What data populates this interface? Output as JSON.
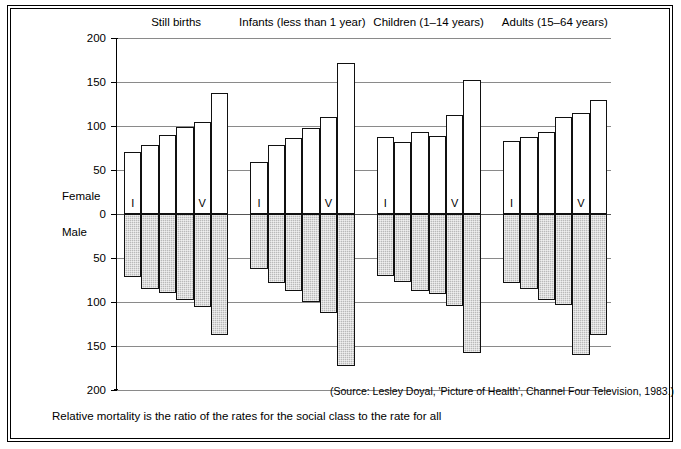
{
  "figure": {
    "axis_labels": {
      "female": "Female",
      "male": "Male"
    },
    "source": "(Source: Lesley Doyal, 'Picture of Health', Channel Four Television, 1983.)",
    "caption": "Relative mortality is the ratio of the rates for the social class to the rate for all",
    "class_label_first": "I",
    "class_label_fifth": "V"
  },
  "chart_data": {
    "type": "bar",
    "title": "",
    "subtitle": "",
    "xlabel": "",
    "ylabel": "",
    "orientation": "vertical",
    "layout": "back-to-back population pyramid: Female above zero, Male below zero",
    "grid": true,
    "legend_position": "none",
    "yticks_upper": [
      0,
      50,
      100,
      150,
      200
    ],
    "yticks_lower": [
      0,
      50,
      100,
      150,
      200
    ],
    "ytick_labels": [
      "200",
      "150",
      "100",
      "50",
      "0",
      "50",
      "100",
      "150",
      "200"
    ],
    "ylim_female": [
      0,
      200
    ],
    "ylim_male": [
      0,
      200
    ],
    "categories": [
      "I",
      "II",
      "IIIN",
      "IIIM",
      "IV",
      "V"
    ],
    "visible_category_labels": [
      "I",
      "",
      "",
      "",
      "V",
      ""
    ],
    "groups": [
      {
        "name": "Still births",
        "female": [
          71,
          78,
          90,
          99,
          105,
          138
        ],
        "male": [
          72,
          85,
          90,
          98,
          106,
          138
        ]
      },
      {
        "name": "Infants (less than 1 year)",
        "female": [
          59,
          78,
          86,
          98,
          110,
          172
        ],
        "male": [
          62,
          78,
          88,
          100,
          112,
          173
        ]
      },
      {
        "name": "Children  (1–14 years)",
        "female": [
          88,
          82,
          93,
          89,
          112,
          152
        ],
        "male": [
          70,
          77,
          88,
          91,
          105,
          158
        ]
      },
      {
        "name": "Adults (15–64 years)",
        "female": [
          83,
          88,
          93,
          110,
          115,
          130
        ],
        "male": [
          78,
          85,
          98,
          103,
          160,
          137
        ]
      }
    ],
    "series": [
      {
        "name": "Female",
        "fill": "#ffffff",
        "position": "above-axis"
      },
      {
        "name": "Male",
        "fill": "#b9b9b9",
        "position": "below-axis"
      }
    ]
  }
}
